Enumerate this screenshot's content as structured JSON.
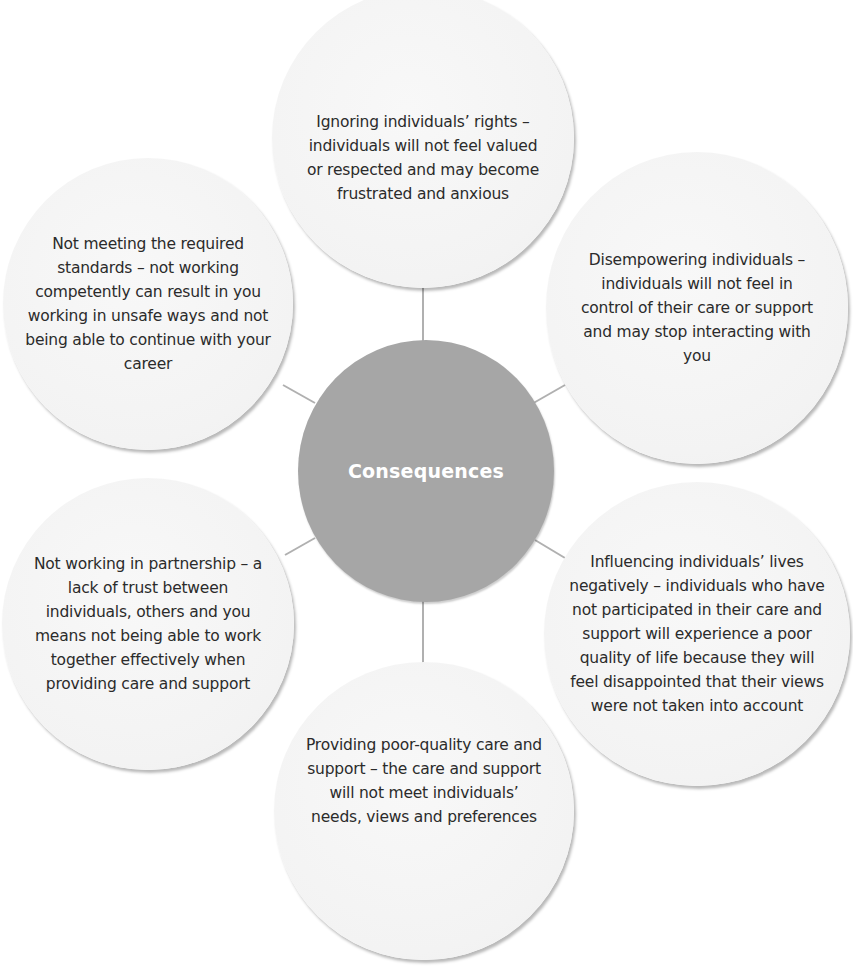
{
  "diagram": {
    "type": "hub-and-spoke",
    "center": {
      "label": "Consequences",
      "color": "#a6a6a6",
      "text_color": "#ffffff"
    },
    "bubble_color": "#f4f4f4",
    "connector_color": "#b0b0b0",
    "nodes": [
      {
        "position": "top",
        "text": "Ignoring individuals’ rights – individuals will not feel valued or respected and may become frustrated and anxious"
      },
      {
        "position": "top-right",
        "text": "Disempowering individuals – individuals will not feel in control of their care or support and may stop interacting with you"
      },
      {
        "position": "bottom-right",
        "text": "Influencing individuals’ lives negatively – individuals who have not participated in their care and support will experience a poor quality of life because they will feel disappointed that their views were not taken into account"
      },
      {
        "position": "bottom",
        "text": "Providing poor-quality care and support – the care and support will not meet individuals’ needs, views and preferences"
      },
      {
        "position": "bottom-left",
        "text": "Not working in partnership – a lack of trust between individuals, others and you means not being able to work together effectively when providing care and support"
      },
      {
        "position": "top-left",
        "text": "Not meeting the required standards – not working competently can result in you working in unsafe ways and not being able to continue with your career"
      }
    ]
  }
}
